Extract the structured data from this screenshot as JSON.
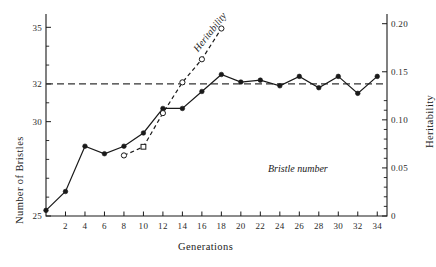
{
  "chart_data": {
    "type": "line",
    "title": "",
    "xlabel": "Generations",
    "ylabel": "Number of Bristles",
    "y2label": "Heritability",
    "xlim": [
      0,
      35
    ],
    "ylim": [
      25,
      35.6
    ],
    "y2lim": [
      0,
      0.208
    ],
    "grid": false,
    "legend_position": "inline-annotations",
    "xticks": [
      2,
      4,
      6,
      8,
      10,
      12,
      14,
      16,
      18,
      20,
      22,
      24,
      26,
      28,
      30,
      32,
      34
    ],
    "xtick_labels": [
      "2",
      "4",
      "6",
      "8",
      "10",
      "12",
      "14",
      "16",
      "18",
      "20",
      "22",
      "24",
      "26",
      "28",
      "30",
      "32",
      "34"
    ],
    "yticks": [
      25,
      30,
      32,
      35
    ],
    "ytick_labels": [
      "25",
      "30",
      "32",
      "35"
    ],
    "y_minor_ticks": [
      26,
      27,
      28,
      29,
      31,
      33,
      34
    ],
    "y2ticks": [
      0,
      0.05,
      0.1,
      0.15,
      0.2
    ],
    "y2tick_labels": [
      "0",
      "0.05",
      "0.10",
      "0.15",
      "0.20"
    ],
    "y2_minor_ticks": [
      0.01,
      0.02,
      0.03,
      0.04,
      0.06,
      0.07,
      0.08,
      0.09,
      0.11,
      0.12
    ],
    "reference_line": {
      "label": "",
      "y_value": 32,
      "style": "dashed"
    },
    "series": [
      {
        "name": "Bristle number",
        "axis": "left",
        "marker": "filled-circle",
        "linestyle": "solid",
        "color": "#1a1a1a",
        "x": [
          0,
          2,
          4,
          6,
          8,
          10,
          12,
          14,
          16,
          18,
          20,
          22,
          24,
          26,
          28,
          30,
          32,
          34
        ],
        "values": [
          25.3,
          26.3,
          28.7,
          28.3,
          28.7,
          29.4,
          30.7,
          30.7,
          31.6,
          32.5,
          32.1,
          32.2,
          31.9,
          32.4,
          31.8,
          32.4,
          31.5,
          32.4
        ]
      },
      {
        "name": "Heritability",
        "axis": "right",
        "marker": "open-circle",
        "linestyle": "dashed",
        "color": "#1a1a1a",
        "x": [
          8,
          10,
          12,
          14,
          16,
          18
        ],
        "values": [
          0.063,
          0.072,
          0.107,
          0.139,
          0.163,
          0.195
        ]
      }
    ],
    "annotations": [
      {
        "text": "Heritability",
        "rotation": -52,
        "x": 15.4,
        "y2": 0.135
      },
      {
        "text": "Bristle number",
        "rotation": 0,
        "x": 25.5,
        "y": 31.0
      }
    ]
  },
  "labels": {
    "x_axis_title": "Generations",
    "y_axis_title": "Number of Bristles",
    "y2_axis_title": "Heritability",
    "series_bristle": "Bristle number",
    "series_heritability": "Heritability"
  },
  "colors": {
    "ink": "#1a1a1a",
    "background": "#ffffff",
    "dashed": "#333333"
  }
}
